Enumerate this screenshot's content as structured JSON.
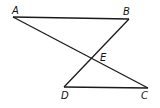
{
  "diagram": {
    "points": {
      "A": {
        "label": "A",
        "x": 13,
        "y": 17
      },
      "B": {
        "label": "B",
        "x": 129,
        "y": 19
      },
      "C": {
        "label": "C",
        "x": 148,
        "y": 88
      },
      "D": {
        "label": "D",
        "x": 64,
        "y": 87
      },
      "E": {
        "label": "E",
        "x": 91,
        "y": 59
      }
    },
    "segments": [
      [
        "A",
        "B"
      ],
      [
        "A",
        "C"
      ],
      [
        "B",
        "D"
      ],
      [
        "D",
        "C"
      ]
    ],
    "line_color": "#1a1a1a"
  }
}
